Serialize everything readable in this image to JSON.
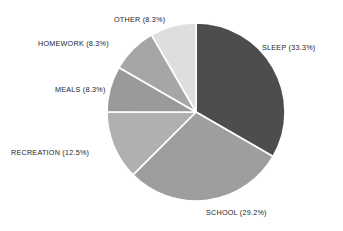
{
  "chart_data": {
    "type": "pie",
    "title": "",
    "subtitle": "",
    "xlabel": "",
    "ylabel": "",
    "legend_position": "none",
    "grid": false,
    "labels_outside": true,
    "start_angle_deg": 0,
    "direction": "clockwise",
    "center": {
      "x": 196,
      "y": 112
    },
    "radius": 89,
    "categories": [
      "SLEEP",
      "SCHOOL",
      "RECREATION",
      "MEALS",
      "HOMEWORK",
      "OTHER"
    ],
    "values": [
      33.3,
      29.2,
      12.5,
      8.3,
      8.3,
      8.3
    ],
    "slices": [
      {
        "name": "SLEEP",
        "label": "SLEEP (33.3%)",
        "value": 33.3,
        "color": "#4d4d4d",
        "start_deg": 0.0,
        "end_deg": 120.0
      },
      {
        "name": "SCHOOL",
        "label": "SCHOOL (29.2%)",
        "value": 29.2,
        "color": "#9e9e9e",
        "start_deg": 120.0,
        "end_deg": 225.1
      },
      {
        "name": "RECREATION",
        "label": "RECREATION (12.5%)",
        "value": 12.5,
        "color": "#b0b0b0",
        "start_deg": 225.1,
        "end_deg": 270.1
      },
      {
        "name": "MEALS",
        "label": "MEALS (8.3%)",
        "value": 8.3,
        "color": "#9a9a9a",
        "start_deg": 270.1,
        "end_deg": 300.0
      },
      {
        "name": "HOMEWORK",
        "label": "HOMEWORK (8.3%)",
        "value": 8.3,
        "color": "#a6a6a6",
        "start_deg": 300.0,
        "end_deg": 330.0
      },
      {
        "name": "OTHER",
        "label": "OTHER (8.3%)",
        "value": 8.3,
        "color": "#dedede",
        "start_deg": 330.0,
        "end_deg": 360.0
      }
    ],
    "separator_color": "#ffffff",
    "background_color": "#ffffff",
    "label_color": "#1c1c1c"
  }
}
